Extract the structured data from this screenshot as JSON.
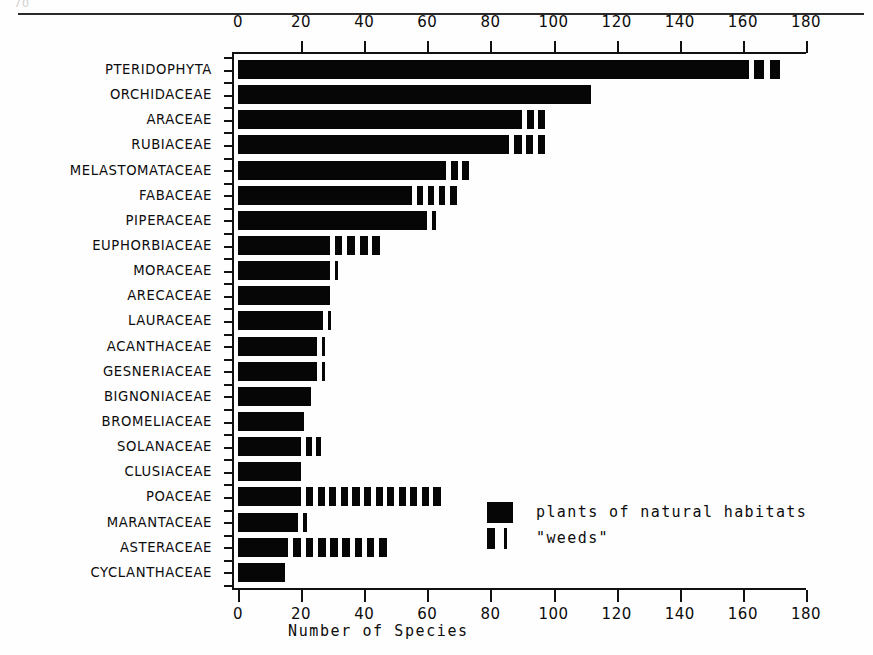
{
  "figure": {
    "top_fragment": "70",
    "background_color": "#ffffff",
    "ink_color": "#060606"
  },
  "legend": {
    "items": [
      {
        "swatch": "solid-block",
        "label": "plants of natural habitats"
      },
      {
        "swatch": "thin-bars",
        "label": "\"weeds\""
      }
    ]
  },
  "chart_data": {
    "type": "bar",
    "orientation": "horizontal",
    "title": "",
    "xlabel": "Number of Species",
    "ylabel": "",
    "xlim": [
      0,
      180
    ],
    "xticks": [
      0,
      20,
      40,
      60,
      80,
      100,
      120,
      140,
      160,
      180
    ],
    "xtick_labels": [
      "0",
      "20",
      "40",
      "60",
      "80",
      "100",
      "120",
      "140",
      "160",
      "180"
    ],
    "axis_top_duplicated": true,
    "grid": false,
    "legend_position": "inside lower right",
    "minor_ticks_y": true,
    "categories": [
      "PTERIDOPHYTA",
      "ORCHIDACEAE",
      "ARACEAE",
      "RUBIACEAE",
      "MELASTOMATACEAE",
      "FABACEAE",
      "PIPERACEAE",
      "EUPHORBIACEAE",
      "MORACEAE",
      "ARECACEAE",
      "LAURACEAE",
      "ACANTHACEAE",
      "GESNERIACEAE",
      "BIGNONIACEAE",
      "BROMELIACEAE",
      "SOLANACEAE",
      "CLUSIACEAE",
      "POACEAE",
      "MARANTACEAE",
      "ASTERACEAE",
      "CYCLANTHACEAE"
    ],
    "series": [
      {
        "name": "plants of natural habitats",
        "values": [
          162,
          112,
          90,
          86,
          66,
          55,
          60,
          29,
          29,
          29,
          27,
          25,
          25,
          23,
          21,
          20,
          20,
          20,
          19,
          16,
          15
        ]
      },
      {
        "name": "\"weeds\"",
        "values": [
          10,
          0,
          7,
          11,
          7,
          14,
          2,
          16,
          2,
          0,
          1,
          1,
          1,
          0,
          0,
          6,
          0,
          44,
          2,
          31,
          0
        ]
      }
    ],
    "totals": [
      172,
      112,
      97,
      97,
      73,
      69,
      62,
      45,
      31,
      29,
      27,
      26,
      26,
      23,
      21,
      26,
      20,
      64,
      21,
      47,
      15
    ],
    "weed_segment_counts": [
      2,
      0,
      2,
      3,
      2,
      4,
      1,
      4,
      1,
      0,
      1,
      1,
      1,
      0,
      0,
      2,
      0,
      12,
      1,
      8,
      0
    ]
  }
}
